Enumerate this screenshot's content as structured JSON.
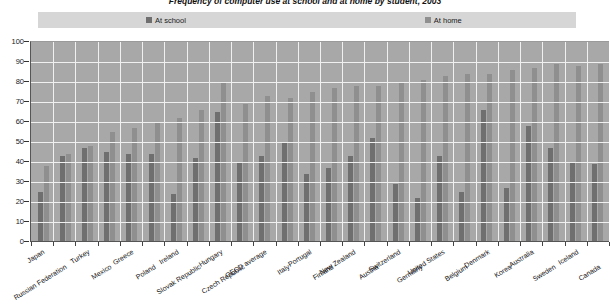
{
  "title": "Frequency of computer use at school and at home by student, 2003",
  "legend": {
    "items": [
      {
        "label": "At school",
        "color": "#6f6f6f",
        "name": "at-school"
      },
      {
        "label": "At home",
        "color": "#8f8f8f",
        "name": "at-home"
      }
    ]
  },
  "axis": {
    "y_ticks": [
      "100",
      "90",
      "80",
      "70",
      "60",
      "50",
      "40",
      "30",
      "20",
      "10",
      "0"
    ]
  },
  "chart_data": {
    "type": "bar",
    "title": "Frequency of computer use at school and at home by student, 2003",
    "xlabel": "",
    "ylabel": "",
    "ylim": [
      0,
      100
    ],
    "ytick_step": 10,
    "grid": true,
    "legend_position": "top",
    "categories": [
      "Japan",
      "Russian Federation",
      "Turkey",
      "Mexico",
      "Greece",
      "Poland",
      "Ireland",
      "Slovak Republic",
      "Hungary",
      "Czech Republic",
      "OECD average",
      "Italy",
      "Portugal",
      "Finland",
      "New Zealand",
      "Austria",
      "Switzerland",
      "Germany",
      "United States",
      "Belgium",
      "Denmark",
      "Korea",
      "Australia",
      "Sweden",
      "Iceland",
      "Canada"
    ],
    "series": [
      {
        "name": "At school",
        "color": "#6f6f6f",
        "values": [
          25,
          43,
          47,
          45,
          44,
          44,
          24,
          42,
          65,
          40,
          43,
          50,
          34,
          37,
          43,
          52,
          29,
          22,
          43,
          25,
          66,
          27,
          58,
          47,
          40,
          39
        ]
      },
      {
        "name": "At home",
        "color": "#8f8f8f",
        "values": [
          38,
          44,
          48,
          55,
          57,
          60,
          62,
          66,
          80,
          69,
          73,
          72,
          75,
          77,
          78,
          78,
          80,
          81,
          83,
          84,
          84,
          86,
          87,
          89,
          88,
          89
        ]
      }
    ]
  }
}
